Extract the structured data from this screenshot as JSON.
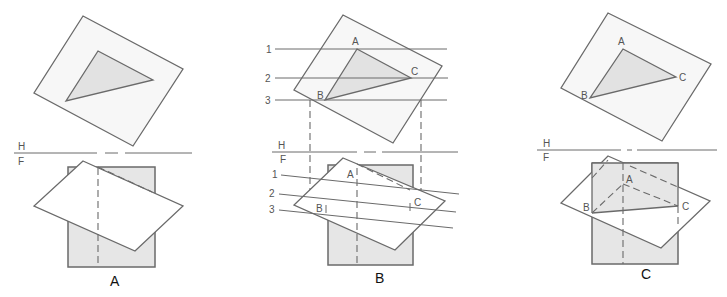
{
  "figure": {
    "panels": [
      {
        "id": "A",
        "caption": "A",
        "fold_line": {
          "upper": "H",
          "lower": "F"
        },
        "point_labels": []
      },
      {
        "id": "B",
        "caption": "B",
        "fold_line": {
          "upper": "H",
          "lower": "F"
        },
        "point_labels": {
          "a": "A",
          "b": "B",
          "c": "C"
        },
        "cutting_lines_top": [
          "1",
          "2",
          "3"
        ],
        "cutting_lines_front": [
          "1",
          "2",
          "3"
        ]
      },
      {
        "id": "C",
        "caption": "C",
        "fold_line": {
          "upper": "H",
          "lower": "F"
        },
        "point_labels": {
          "a": "A",
          "b": "B",
          "c": "C"
        }
      }
    ],
    "colors": {
      "line": "#6a6a6a",
      "triangle_fill": "#e2e2e2",
      "rect_fill": "#e6e6e6",
      "background": "#ffffff"
    }
  }
}
